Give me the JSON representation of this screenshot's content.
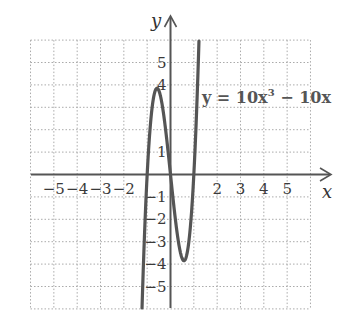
{
  "chart_data": {
    "type": "line",
    "title": "",
    "xlabel": "x",
    "ylabel": "y",
    "xlim": [
      -6,
      6
    ],
    "ylim": [
      -6,
      6
    ],
    "grid": true,
    "grid_style": "dotted",
    "x_tick_labels": [
      "−5",
      "−4",
      "−3",
      "−2",
      "2",
      "3",
      "4",
      "5"
    ],
    "x_tick_values": [
      -5,
      -4,
      -3,
      -2,
      2,
      3,
      4,
      5
    ],
    "y_tick_labels": [
      "5",
      "4",
      "1",
      "−1",
      "−2",
      "−3",
      "−4",
      "−5"
    ],
    "y_tick_values": [
      5,
      4,
      1,
      -1,
      -2,
      -3,
      -4,
      -5
    ],
    "series": [
      {
        "name": "y = 10x³ − 10x",
        "function": "10x^3 - 10x",
        "color": "#555555",
        "x": [
          -1.24,
          -1.2,
          -1.1,
          -1.0,
          -0.9,
          -0.8,
          -0.7,
          -0.577,
          -0.5,
          -0.4,
          -0.3,
          -0.2,
          -0.1,
          0,
          0.1,
          0.2,
          0.3,
          0.4,
          0.5,
          0.577,
          0.7,
          0.8,
          0.9,
          1.0,
          1.1,
          1.2,
          1.22
        ],
        "values": [
          -6.67,
          -5.28,
          -2.31,
          0,
          1.71,
          2.88,
          3.57,
          3.85,
          3.75,
          3.36,
          2.73,
          1.92,
          0.99,
          0,
          -0.99,
          -1.92,
          -2.73,
          -3.36,
          -3.75,
          -3.85,
          -3.57,
          -2.88,
          -1.71,
          0,
          2.31,
          5.28,
          5.96
        ]
      }
    ],
    "annotations": [
      {
        "text": "y = 10x³ − 10x",
        "position": "right of curve, near y=4"
      }
    ]
  },
  "labels": {
    "x_axis": "x",
    "y_axis": "y",
    "equation_prefix": "y = 10x",
    "equation_exp": "3",
    "equation_suffix": " − 10x"
  }
}
